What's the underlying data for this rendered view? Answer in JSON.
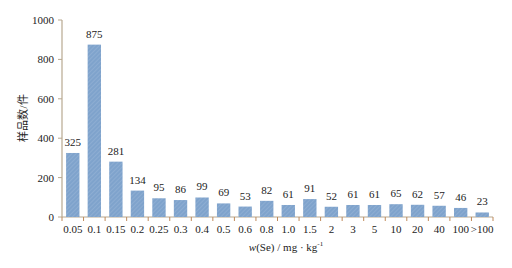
{
  "chart_data": {
    "type": "bar",
    "title": "",
    "xlabel": "w(Se) / mg·kg⁻¹",
    "ylabel": "样品数/件",
    "ylim": [
      0,
      1000
    ],
    "yticks": [
      0,
      200,
      400,
      600,
      800,
      1000
    ],
    "grid": false,
    "legend": null,
    "categories": [
      "0.05",
      "0.1",
      "0.15",
      "0.2",
      "0.25",
      "0.3",
      "0.4",
      "0.5",
      "0.6",
      "0.8",
      "1.0",
      "1.5",
      "2",
      "3",
      "5",
      "10",
      "20",
      "40",
      "100",
      ">100"
    ],
    "values": [
      325,
      875,
      281,
      134,
      95,
      86,
      99,
      69,
      53,
      82,
      61,
      91,
      52,
      61,
      61,
      65,
      62,
      57,
      46,
      23
    ],
    "data_labels": true,
    "bar_color": "#7fa3cc"
  },
  "axis": {
    "xlabel_var": "w",
    "xlabel_rest": "(Se) / mg · kg",
    "xlabel_sup": "-1",
    "ylabel": "样品数/件"
  }
}
